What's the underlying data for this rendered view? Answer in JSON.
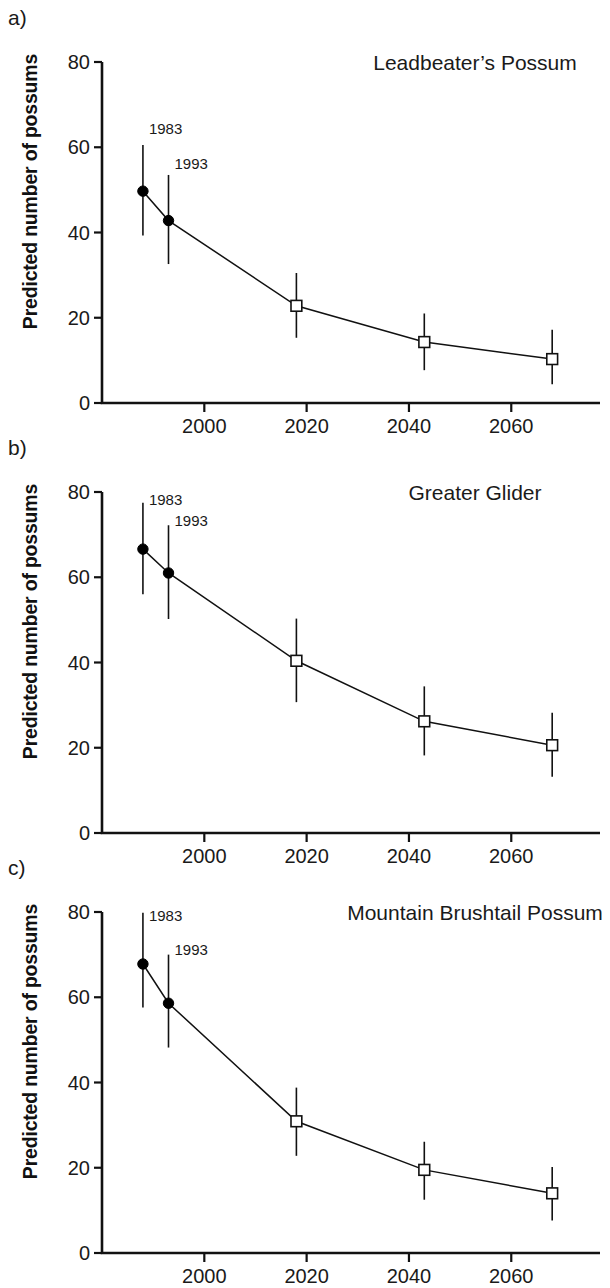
{
  "figure": {
    "ylabel": "Predicted number of possums",
    "panel_letters": [
      "a)",
      "b)",
      "c)"
    ]
  },
  "chart_data": [
    {
      "type": "line",
      "panel": "a)",
      "title": "Leadbeater’s Possum",
      "xlabel": "",
      "ylabel": "Predicted number of possums",
      "xlim": [
        1980,
        2075
      ],
      "ylim": [
        0,
        80
      ],
      "xticks": [
        2000,
        2020,
        2040,
        2060
      ],
      "xtick_labels": [
        "2000",
        "2020",
        "2040",
        "2060"
      ],
      "yticks": [
        0,
        20,
        40,
        60,
        80
      ],
      "ytick_labels": [
        "0",
        "20",
        "40",
        "60",
        "80"
      ],
      "grid": false,
      "legend": "none",
      "annotations": [
        {
          "text": "1983",
          "x": 1988,
          "y": 63
        },
        {
          "text": "1993",
          "x": 1993,
          "y": 55
        }
      ],
      "points": [
        {
          "x": 1988,
          "y": 49.7,
          "lower": 39.3,
          "upper": 60.5,
          "marker": "filled-circle"
        },
        {
          "x": 1993,
          "y": 42.8,
          "lower": 32.6,
          "upper": 53.5,
          "marker": "filled-circle"
        },
        {
          "x": 2018,
          "y": 22.8,
          "lower": 15.3,
          "upper": 30.5,
          "marker": "open-square"
        },
        {
          "x": 2043,
          "y": 14.3,
          "lower": 7.7,
          "upper": 21.0,
          "marker": "open-square"
        },
        {
          "x": 2068,
          "y": 10.3,
          "lower": 4.4,
          "upper": 17.2,
          "marker": "open-square"
        }
      ]
    },
    {
      "type": "line",
      "panel": "b)",
      "title": "Greater Glider",
      "xlabel": "",
      "ylabel": "Predicted number of possums",
      "xlim": [
        1980,
        2075
      ],
      "ylim": [
        0,
        80
      ],
      "xticks": [
        2000,
        2020,
        2040,
        2060
      ],
      "xtick_labels": [
        "2000",
        "2020",
        "2040",
        "2060"
      ],
      "yticks": [
        0,
        20,
        40,
        60,
        80
      ],
      "ytick_labels": [
        "0",
        "20",
        "40",
        "60",
        "80"
      ],
      "grid": false,
      "legend": "none",
      "annotations": [
        {
          "text": "1983",
          "x": 1988,
          "y": 77
        },
        {
          "text": "1993",
          "x": 1993,
          "y": 72
        }
      ],
      "points": [
        {
          "x": 1988,
          "y": 66.6,
          "lower": 56.0,
          "upper": 77.5,
          "marker": "filled-circle"
        },
        {
          "x": 1993,
          "y": 61.0,
          "lower": 50.2,
          "upper": 72.2,
          "marker": "filled-circle"
        },
        {
          "x": 2018,
          "y": 40.4,
          "lower": 30.7,
          "upper": 50.3,
          "marker": "open-square"
        },
        {
          "x": 2043,
          "y": 26.2,
          "lower": 18.2,
          "upper": 34.4,
          "marker": "open-square"
        },
        {
          "x": 2068,
          "y": 20.6,
          "lower": 13.2,
          "upper": 28.2,
          "marker": "open-square"
        }
      ]
    },
    {
      "type": "line",
      "panel": "c)",
      "title": "Mountain Brushtail Possum",
      "xlabel": "",
      "ylabel": "Predicted number of possums",
      "xlim": [
        1980,
        2075
      ],
      "ylim": [
        0,
        80
      ],
      "xticks": [
        2000,
        2020,
        2040,
        2060
      ],
      "xtick_labels": [
        "2000",
        "2020",
        "2040",
        "2060"
      ],
      "yticks": [
        0,
        20,
        40,
        60,
        80
      ],
      "ytick_labels": [
        "0",
        "20",
        "40",
        "60",
        "80"
      ],
      "grid": false,
      "legend": "none",
      "annotations": [
        {
          "text": "1983",
          "x": 1988,
          "y": 78
        },
        {
          "text": "1993",
          "x": 1993,
          "y": 70
        }
      ],
      "points": [
        {
          "x": 1988,
          "y": 67.8,
          "lower": 57.6,
          "upper": 79.8,
          "marker": "filled-circle"
        },
        {
          "x": 1993,
          "y": 58.6,
          "lower": 48.2,
          "upper": 70.0,
          "marker": "filled-circle"
        },
        {
          "x": 2018,
          "y": 30.9,
          "lower": 22.8,
          "upper": 38.8,
          "marker": "open-square"
        },
        {
          "x": 2043,
          "y": 19.5,
          "lower": 12.5,
          "upper": 26.1,
          "marker": "open-square"
        },
        {
          "x": 2068,
          "y": 14.0,
          "lower": 7.6,
          "upper": 20.2,
          "marker": "open-square"
        }
      ]
    }
  ]
}
